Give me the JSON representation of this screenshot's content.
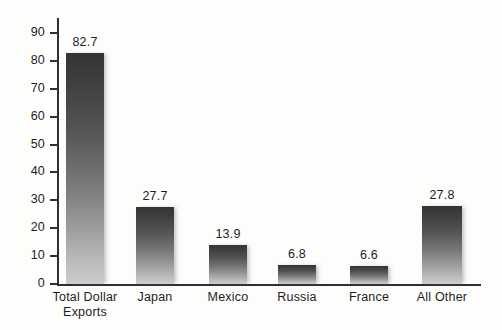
{
  "chart_data": {
    "type": "bar",
    "title": "",
    "subtitle": "",
    "xlabel": "",
    "ylabel": "",
    "categories": [
      "Total Dollar\nExports",
      "Japan",
      "Mexico",
      "Russia",
      "France",
      "All Other"
    ],
    "values": [
      82.7,
      27.7,
      13.9,
      6.8,
      6.6,
      27.8
    ],
    "value_labels": [
      "82.7",
      "27.7",
      "13.9",
      "6.8",
      "6.6",
      "27.8"
    ],
    "ylim": [
      0,
      90
    ],
    "ytick_step": 10,
    "ytick_labels": [
      "0",
      "10",
      "20",
      "30",
      "40",
      "50",
      "60",
      "70",
      "80",
      "90"
    ],
    "grid": false,
    "legend": null,
    "bar_style": "vertical-gradient-dark-top-to-light-bottom",
    "colors": {
      "bar_top": "#343434",
      "bar_bottom": "#cccccc",
      "axis": "#2f2f2f",
      "text": "#1d1d1d",
      "background": "#fdfdfc"
    }
  }
}
